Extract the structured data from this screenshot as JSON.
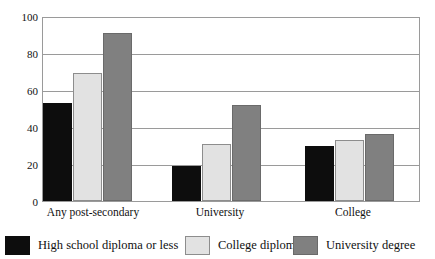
{
  "chart_data": {
    "type": "bar",
    "title": "",
    "xlabel": "",
    "ylabel": "",
    "ylim": [
      0,
      100
    ],
    "yticks": [
      0,
      20,
      40,
      60,
      80,
      100
    ],
    "grid": true,
    "legend_position": "bottom",
    "categories": [
      "Any post-secondary",
      "University",
      "College"
    ],
    "series": [
      {
        "name": "High school diploma or less",
        "color": "#0d0d0d",
        "values": [
          53,
          19,
          30
        ]
      },
      {
        "name": "College diploma",
        "color": "#e2e2e2",
        "values": [
          69,
          31,
          33
        ]
      },
      {
        "name": "University degree",
        "color": "#808080",
        "values": [
          91,
          52,
          36
        ]
      }
    ]
  },
  "axis": {
    "ytick_labels": [
      "100",
      "80",
      "60",
      "40",
      "20",
      "0"
    ]
  },
  "legend": {
    "items": [
      {
        "label": "High school diploma or less"
      },
      {
        "label": "College diploma"
      },
      {
        "label": "University degree"
      }
    ]
  }
}
